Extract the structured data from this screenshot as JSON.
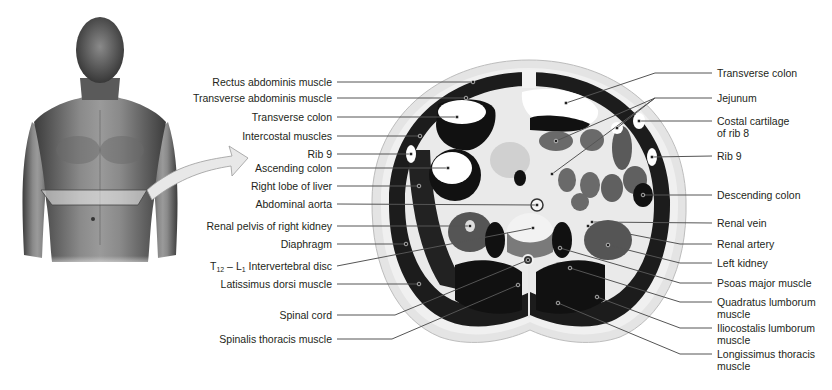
{
  "figure": {
    "photo": {
      "subject": "male torso, anterior view",
      "section_band": "horizontal plane at upper abdomen"
    },
    "arrow": "points from section band on torso to cross-section"
  },
  "labels_left": [
    {
      "id": "rectus-abdominis",
      "text": "Rectus abdominis muscle",
      "y": 82,
      "target": [
        473,
        82
      ]
    },
    {
      "id": "transverse-abdominis",
      "text": "Transverse abdominis muscle",
      "y": 98,
      "target": [
        466,
        98
      ]
    },
    {
      "id": "transverse-colon-left",
      "text": "Transverse colon",
      "y": 117,
      "target": [
        457,
        117
      ]
    },
    {
      "id": "intercostal-muscles",
      "text": "Intercostal muscles",
      "y": 136,
      "target": [
        420,
        136
      ]
    },
    {
      "id": "rib-9-left",
      "text": "Rib 9",
      "y": 154,
      "target": [
        411,
        154
      ]
    },
    {
      "id": "ascending-colon",
      "text": "Ascending colon",
      "y": 168,
      "target": [
        448,
        168
      ]
    },
    {
      "id": "right-lobe-liver",
      "text": "Right lobe of liver",
      "y": 186,
      "target": [
        419,
        186
      ]
    },
    {
      "id": "abdominal-aorta",
      "text": "Abdominal aorta",
      "y": 204,
      "target": [
        537,
        205
      ]
    },
    {
      "id": "renal-pelvis",
      "text": "Renal pelvis of right kidney",
      "y": 226,
      "target": [
        470,
        226
      ]
    },
    {
      "id": "diaphragm",
      "text": "Diaphragm",
      "y": 244,
      "target": [
        406,
        244
      ]
    },
    {
      "id": "t12-l1-disc",
      "text_parts": [
        "T",
        "12",
        " – L",
        "1",
        " Intervertebral disc"
      ],
      "y": 266,
      "target": [
        533,
        228
      ]
    },
    {
      "id": "latissimus-dorsi",
      "text": "Latissimus dorsi muscle",
      "y": 284,
      "target": [
        419,
        284
      ]
    },
    {
      "id": "spinal-cord",
      "text": "Spinal cord",
      "y": 315,
      "target": [
        528,
        260
      ]
    },
    {
      "id": "spinalis-thoracis",
      "text": "Spinalis thoracis muscle",
      "y": 339,
      "target": [
        518,
        285
      ]
    }
  ],
  "labels_right": [
    {
      "id": "transverse-colon-right",
      "lines": [
        "Transverse colon"
      ],
      "y": 73,
      "targets": [
        [
          566,
          103
        ]
      ]
    },
    {
      "id": "jejunum",
      "lines": [
        "Jejunum"
      ],
      "y": 98,
      "targets": [
        [
          556,
          141
        ],
        [
          615,
          128
        ],
        [
          552,
          174
        ]
      ]
    },
    {
      "id": "costal-cartilage",
      "lines": [
        "Costal cartilage",
        "of rib 8"
      ],
      "y": 121,
      "targets": [
        [
          639,
          121
        ]
      ]
    },
    {
      "id": "rib-9-right",
      "lines": [
        "Rib 9"
      ],
      "y": 156,
      "targets": [
        [
          652,
          157
        ]
      ]
    },
    {
      "id": "descending-colon",
      "lines": [
        "Descending colon"
      ],
      "y": 195,
      "targets": [
        [
          643,
          195
        ]
      ]
    },
    {
      "id": "renal-vein",
      "lines": [
        "Renal vein"
      ],
      "y": 223,
      "targets": [
        [
          592,
          222
        ]
      ]
    },
    {
      "id": "renal-artery",
      "lines": [
        "Renal artery"
      ],
      "y": 244,
      "targets": [
        [
          588,
          226
        ]
      ]
    },
    {
      "id": "left-kidney",
      "lines": [
        "Left kidney"
      ],
      "y": 263,
      "targets": [
        [
          608,
          245
        ]
      ]
    },
    {
      "id": "psoas-major",
      "lines": [
        "Psoas major muscle"
      ],
      "y": 283,
      "targets": [
        [
          560,
          248
        ]
      ]
    },
    {
      "id": "quadratus-lumborum",
      "lines": [
        "Quadratus lumborum",
        "muscle"
      ],
      "y": 302,
      "targets": [
        [
          570,
          268
        ]
      ]
    },
    {
      "id": "iliocostalis-lumborum",
      "lines": [
        "Iliocostalis lumborum",
        "muscle"
      ],
      "y": 328,
      "targets": [
        [
          597,
          297
        ]
      ]
    },
    {
      "id": "longissimus-thoracis",
      "lines": [
        "Longissimus thoracis",
        "muscle"
      ],
      "y": 354,
      "targets": [
        [
          558,
          303
        ]
      ]
    }
  ],
  "colors": {
    "text": "#231f20",
    "leader": "#555555",
    "tissue_dark": "#1a1a1a",
    "tissue_mid": "#6e6e6e",
    "tissue_light": "#d8d8d8",
    "arrow_fill": "#e6e6e6"
  }
}
